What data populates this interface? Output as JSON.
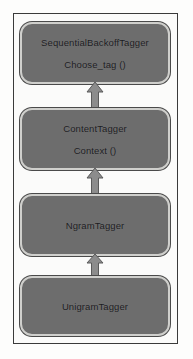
{
  "diagram": {
    "type": "class-hierarchy",
    "title": "",
    "orientation": "bottom-to-top",
    "colors": {
      "node_fill": "#6d6d6d",
      "node_border": "#cfcfcc",
      "frame_border": "#3a3a3a",
      "arrow_fill": "#8c8c8c",
      "arrow_border": "#5a5a5a",
      "background": "#fdfdfc",
      "text": "#1c1c1f"
    },
    "nodes": [
      {
        "id": "sequential-backoff-tagger",
        "primary": "SequentialBackoffTagger",
        "secondary": "Choose_tag ()"
      },
      {
        "id": "content-tagger",
        "primary": "ContentTagger",
        "secondary": "Context ()"
      },
      {
        "id": "ngram-tagger",
        "primary": "NgramTagger",
        "secondary": ""
      },
      {
        "id": "unigram-tagger",
        "primary": "UnigramTagger",
        "secondary": ""
      }
    ],
    "edges": [
      {
        "id": "edge-ngram-to-unigram",
        "from": "UnigramTagger",
        "to": "NgramTagger",
        "marker": "arrow-up"
      },
      {
        "id": "edge-content-to-ngram",
        "from": "NgramTagger",
        "to": "ContentTagger",
        "marker": "arrow-up"
      },
      {
        "id": "edge-sequential-to-content",
        "from": "ContentTagger",
        "to": "SequentialBackoffTagger",
        "marker": "arrow-up"
      }
    ]
  }
}
